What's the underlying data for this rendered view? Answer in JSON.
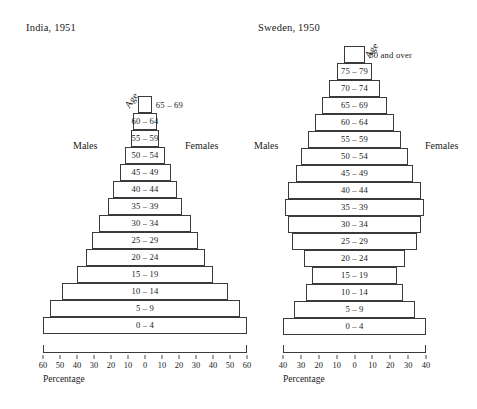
{
  "figure": {
    "axis_caption": "Percentage",
    "age_axis_label": "Age",
    "males_label": "Males",
    "females_label": "Females"
  },
  "chart_data": [
    {
      "type": "bar",
      "title": "India, 1951",
      "subtype": "population-pyramid",
      "xlabel": "Percentage",
      "ylabel": "Age",
      "xlim": [
        -60,
        60
      ],
      "axis_ticks": [
        60,
        50,
        40,
        30,
        20,
        10,
        0,
        10,
        20,
        30,
        40,
        50,
        60
      ],
      "grid": false,
      "legend_position": "inline",
      "categories": [
        "0 – 4",
        "5 – 9",
        "10 – 14",
        "15 – 19",
        "20 – 24",
        "25 – 29",
        "30 – 34",
        "35 – 39",
        "40 – 44",
        "45 – 49",
        "50 – 54",
        "55 – 59",
        "60 – 64",
        "65 – 69"
      ],
      "series": [
        {
          "name": "Males",
          "values": [
            60,
            56,
            49,
            40,
            35,
            31,
            27,
            22,
            19,
            15,
            12,
            8,
            7,
            4
          ]
        },
        {
          "name": "Females",
          "values": [
            60,
            56,
            49,
            40,
            35,
            31,
            27,
            22,
            19,
            15,
            12,
            8,
            7,
            4
          ]
        }
      ],
      "label_outside": [
        false,
        false,
        false,
        false,
        false,
        false,
        false,
        false,
        false,
        false,
        false,
        false,
        false,
        true
      ]
    },
    {
      "type": "bar",
      "title": "Sweden, 1950",
      "subtype": "population-pyramid",
      "xlabel": "Percentage",
      "ylabel": "Age",
      "xlim": [
        -40,
        40
      ],
      "axis_ticks": [
        40,
        30,
        20,
        10,
        0,
        10,
        20,
        30,
        40
      ],
      "grid": false,
      "legend_position": "inline",
      "categories": [
        "0 – 4",
        "5 – 9",
        "10 – 14",
        "15 – 19",
        "20 – 24",
        "25 – 29",
        "30 – 34",
        "35 – 39",
        "40 – 44",
        "45 – 49",
        "50 – 54",
        "55 – 59",
        "60 – 64",
        "65 – 69",
        "70 – 74",
        "75 – 79",
        "80 and over"
      ],
      "series": [
        {
          "name": "Males",
          "values": [
            40,
            34,
            27,
            24,
            28,
            35,
            37,
            39,
            37,
            33,
            30,
            26,
            22,
            18,
            14,
            10,
            6
          ]
        },
        {
          "name": "Females",
          "values": [
            40,
            34,
            27,
            24,
            28,
            35,
            37,
            39,
            37,
            33,
            30,
            26,
            22,
            18,
            14,
            10,
            6
          ]
        }
      ],
      "label_outside": [
        false,
        false,
        false,
        false,
        false,
        false,
        false,
        false,
        false,
        false,
        false,
        false,
        false,
        false,
        false,
        false,
        true
      ]
    }
  ]
}
